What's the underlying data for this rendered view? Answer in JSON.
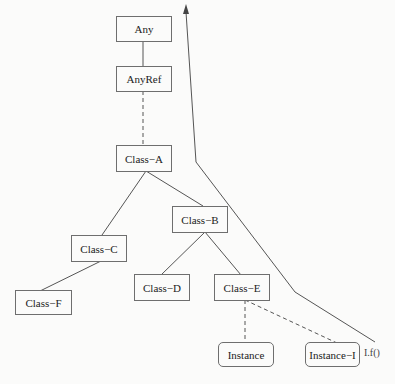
{
  "diagram": {
    "type": "class-hierarchy",
    "nodes": [
      {
        "id": "any",
        "label": "Any",
        "shape": "rect"
      },
      {
        "id": "anyref",
        "label": "AnyRef",
        "shape": "rect"
      },
      {
        "id": "class_a",
        "label": "Class−A",
        "shape": "rect"
      },
      {
        "id": "class_b",
        "label": "Class−B",
        "shape": "rect"
      },
      {
        "id": "class_c",
        "label": "Class−C",
        "shape": "rect"
      },
      {
        "id": "class_d",
        "label": "Class−D",
        "shape": "rect"
      },
      {
        "id": "class_e",
        "label": "Class−E",
        "shape": "rect"
      },
      {
        "id": "class_f",
        "label": "Class−F",
        "shape": "rect"
      },
      {
        "id": "instance",
        "label": "Instance",
        "shape": "rounded"
      },
      {
        "id": "instance_i",
        "label": "Instance−I",
        "shape": "rounded"
      }
    ],
    "edges": [
      {
        "from": "any",
        "to": "anyref",
        "style": "solid"
      },
      {
        "from": "anyref",
        "to": "class_a",
        "style": "dashed"
      },
      {
        "from": "class_a",
        "to": "class_c",
        "style": "solid"
      },
      {
        "from": "class_a",
        "to": "class_b",
        "style": "solid"
      },
      {
        "from": "class_c",
        "to": "class_f",
        "style": "solid"
      },
      {
        "from": "class_b",
        "to": "class_d",
        "style": "solid"
      },
      {
        "from": "class_b",
        "to": "class_e",
        "style": "solid"
      },
      {
        "from": "class_e",
        "to": "instance",
        "style": "dashed"
      },
      {
        "from": "class_e",
        "to": "instance_i",
        "style": "dashed"
      }
    ],
    "lookup_path": {
      "label": "I.f()",
      "description": "method lookup arrow from Instance-I up through hierarchy",
      "style": "solid-arrow"
    }
  }
}
